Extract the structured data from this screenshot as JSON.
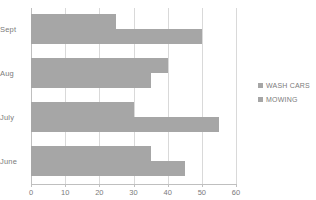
{
  "chart_data": {
    "type": "bar",
    "orientation": "horizontal",
    "title": "",
    "xlabel": "",
    "ylabel": "",
    "categories": [
      "Sept",
      "Aug",
      "July",
      "June"
    ],
    "series": [
      {
        "name": "WASH CARS",
        "values": [
          25,
          40,
          30,
          35
        ],
        "color": "#a6a6a6"
      },
      {
        "name": "MOWING",
        "values": [
          50,
          35,
          55,
          45
        ],
        "color": "#a6a6a6"
      }
    ],
    "xlim": [
      0,
      60
    ],
    "xticks": [
      0,
      10,
      20,
      30,
      40,
      50,
      60
    ],
    "xtick_labels": [
      "0",
      "10",
      "20",
      "30",
      "40",
      "50",
      "60"
    ],
    "grid": true,
    "grid_axis": "x",
    "legend_position": "right"
  },
  "legend": {
    "items": [
      {
        "label": "WASH CARS"
      },
      {
        "label": "MOWING"
      }
    ]
  },
  "colors": {
    "bar": "#a6a6a6",
    "grid": "#d9d9d9",
    "axis": "#bfbfbf",
    "text": "#7b7b7b",
    "background": "#ffffff"
  }
}
